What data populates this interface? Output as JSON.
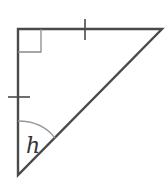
{
  "diagram": {
    "type": "right-triangle",
    "angle_label": "h",
    "right_angle_marker": true,
    "equal_side_ticks": 2,
    "colors": {
      "stroke": "#4a4a4a",
      "marker": "#8a8a8a",
      "label": "#333333"
    }
  }
}
